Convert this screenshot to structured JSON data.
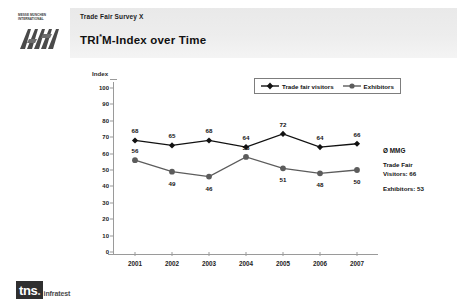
{
  "header": {
    "subtitle": "Trade Fair Survey X",
    "title_main": "TRI",
    "title_star": "*",
    "title_rest": "M-Index over Time"
  },
  "brand_logo": {
    "line1": "MESSE MÜNCHEN",
    "line2": "INTERNATIONAL",
    "mark": "messe-muenchen-m-mark"
  },
  "footer_logo": {
    "mark": "tns",
    "word": "infratest"
  },
  "legend": {
    "items": [
      {
        "label": "Trade fair visitors",
        "color": "#111111",
        "marker": "diamond"
      },
      {
        "label": "Exhibitors",
        "color": "#5c5c5c",
        "marker": "circle"
      }
    ]
  },
  "note": {
    "heading": "Ø MMG",
    "line1": "Trade Fair\nVisitors: 66",
    "line2": "Exhibitors: 53"
  },
  "chart_data": {
    "type": "line",
    "title": "TRI*M-Index over Time",
    "xlabel": "",
    "ylabel": "Index",
    "ylim": [
      0,
      100
    ],
    "yticks": [
      0,
      10,
      20,
      30,
      40,
      50,
      60,
      70,
      80,
      90,
      100
    ],
    "grid": false,
    "legend_position": "top-right",
    "categories": [
      "2001",
      "2002",
      "2003",
      "2004",
      "2005",
      "2006",
      "2007"
    ],
    "series": [
      {
        "name": "Trade fair visitors",
        "color": "#111111",
        "marker": "diamond",
        "values": [
          68,
          65,
          68,
          64,
          72,
          64,
          66
        ]
      },
      {
        "name": "Exhibitors",
        "color": "#5c5c5c",
        "marker": "circle",
        "values": [
          56,
          49,
          46,
          58,
          51,
          48,
          50
        ]
      }
    ]
  }
}
